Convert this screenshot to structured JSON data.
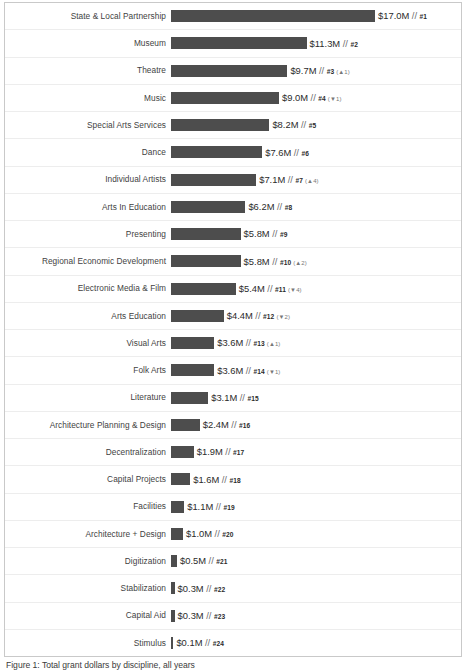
{
  "chart_data": {
    "type": "bar",
    "orientation": "horizontal",
    "title": "",
    "subtitle": "",
    "xlabel": "",
    "ylabel": "",
    "xlim": [
      0,
      17.0
    ],
    "grid": false,
    "legend": false,
    "value_unit": "$M",
    "bar_color": "#4d4d4d",
    "categories": [
      "State & Local Partnership",
      "Museum",
      "Theatre",
      "Music",
      "Special Arts Services",
      "Dance",
      "Individual Artists",
      "Arts In Education",
      "Presenting",
      "Regional Economic Development",
      "Electronic Media & Film",
      "Arts Education",
      "Visual Arts",
      "Folk Arts",
      "Literature",
      "Architecture Planning & Design",
      "Decentralization",
      "Capital Projects",
      "Facilities",
      "Architecture + Design",
      "Digitization",
      "Stabilization",
      "Capital Aid",
      "Stimulus"
    ],
    "values": [
      17.0,
      11.3,
      9.7,
      9.0,
      8.2,
      7.6,
      7.1,
      6.2,
      5.8,
      5.8,
      5.4,
      4.4,
      3.6,
      3.6,
      3.1,
      2.4,
      1.9,
      1.6,
      1.1,
      1.0,
      0.5,
      0.3,
      0.3,
      0.1
    ]
  },
  "rows": [
    {
      "label": "State & Local Partnership",
      "value": 17.0,
      "value_text": "$17.0M",
      "separator": "//",
      "rank": "#1",
      "delta": ""
    },
    {
      "label": "Museum",
      "value": 11.3,
      "value_text": "$11.3M",
      "separator": "//",
      "rank": "#2",
      "delta": ""
    },
    {
      "label": "Theatre",
      "value": 9.7,
      "value_text": "$9.7M",
      "separator": "//",
      "rank": "#3",
      "delta": "(▲1)"
    },
    {
      "label": "Music",
      "value": 9.0,
      "value_text": "$9.0M",
      "separator": "//",
      "rank": "#4",
      "delta": "(▼1)"
    },
    {
      "label": "Special Arts Services",
      "value": 8.2,
      "value_text": "$8.2M",
      "separator": "//",
      "rank": "#5",
      "delta": ""
    },
    {
      "label": "Dance",
      "value": 7.6,
      "value_text": "$7.6M",
      "separator": "//",
      "rank": "#6",
      "delta": ""
    },
    {
      "label": "Individual Artists",
      "value": 7.1,
      "value_text": "$7.1M",
      "separator": "//",
      "rank": "#7",
      "delta": "(▲4)"
    },
    {
      "label": "Arts In Education",
      "value": 6.2,
      "value_text": "$6.2M",
      "separator": "//",
      "rank": "#8",
      "delta": ""
    },
    {
      "label": "Presenting",
      "value": 5.8,
      "value_text": "$5.8M",
      "separator": "//",
      "rank": "#9",
      "delta": ""
    },
    {
      "label": "Regional Economic Development",
      "value": 5.8,
      "value_text": "$5.8M",
      "separator": "//",
      "rank": "#10",
      "delta": "(▲2)"
    },
    {
      "label": "Electronic Media & Film",
      "value": 5.4,
      "value_text": "$5.4M",
      "separator": "//",
      "rank": "#11",
      "delta": "(▼4)"
    },
    {
      "label": "Arts Education",
      "value": 4.4,
      "value_text": "$4.4M",
      "separator": "//",
      "rank": "#12",
      "delta": "(▼2)"
    },
    {
      "label": "Visual Arts",
      "value": 3.6,
      "value_text": "$3.6M",
      "separator": "//",
      "rank": "#13",
      "delta": "(▲1)"
    },
    {
      "label": "Folk Arts",
      "value": 3.6,
      "value_text": "$3.6M",
      "separator": "//",
      "rank": "#14",
      "delta": "(▼1)"
    },
    {
      "label": "Literature",
      "value": 3.1,
      "value_text": "$3.1M",
      "separator": "//",
      "rank": "#15",
      "delta": ""
    },
    {
      "label": "Architecture Planning & Design",
      "value": 2.4,
      "value_text": "$2.4M",
      "separator": "//",
      "rank": "#16",
      "delta": ""
    },
    {
      "label": "Decentralization",
      "value": 1.9,
      "value_text": "$1.9M",
      "separator": "//",
      "rank": "#17",
      "delta": ""
    },
    {
      "label": "Capital Projects",
      "value": 1.6,
      "value_text": "$1.6M",
      "separator": "//",
      "rank": "#18",
      "delta": ""
    },
    {
      "label": "Facilities",
      "value": 1.1,
      "value_text": "$1.1M",
      "separator": "//",
      "rank": "#19",
      "delta": ""
    },
    {
      "label": "Architecture + Design",
      "value": 1.0,
      "value_text": "$1.0M",
      "separator": "//",
      "rank": "#20",
      "delta": ""
    },
    {
      "label": "Digitization",
      "value": 0.5,
      "value_text": "$0.5M",
      "separator": "//",
      "rank": "#21",
      "delta": ""
    },
    {
      "label": "Stabilization",
      "value": 0.3,
      "value_text": "$0.3M",
      "separator": "//",
      "rank": "#22",
      "delta": ""
    },
    {
      "label": "Capital Aid",
      "value": 0.3,
      "value_text": "$0.3M",
      "separator": "//",
      "rank": "#23",
      "delta": ""
    },
    {
      "label": "Stimulus",
      "value": 0.1,
      "value_text": "$0.1M",
      "separator": "//",
      "rank": "#24",
      "delta": ""
    }
  ],
  "caption": {
    "text": "Figure 1: Total grant dollars by discipline, all years"
  }
}
